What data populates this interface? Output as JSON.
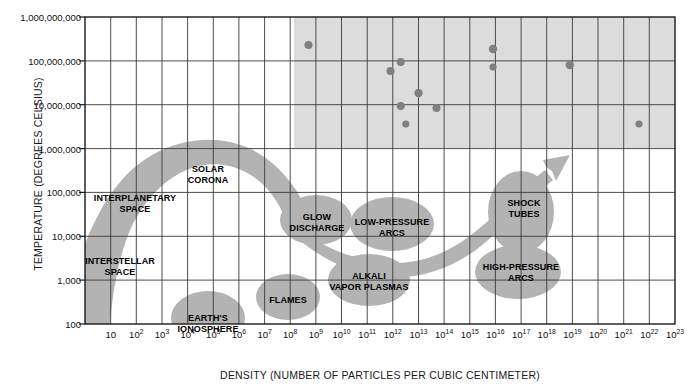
{
  "chart_data": {
    "type": "scatter",
    "title": "",
    "xlabel": "DENSITY (NUMBER OF PARTICLES PER CUBIC CENTIMETER)",
    "ylabel": "TEMPERATURE (DEGREES CELSIUS)",
    "xscale": "log",
    "yscale": "log",
    "xlim": [
      1,
      1e+23
    ],
    "ylim": [
      100,
      1000000000
    ],
    "grid": true,
    "legend": "none",
    "xticks": [
      {
        "label": "10",
        "exp": "",
        "value": 1
      },
      {
        "label": "10",
        "exp": "2",
        "value": 2
      },
      {
        "label": "10",
        "exp": "3",
        "value": 3
      },
      {
        "label": "10",
        "exp": "4",
        "value": 4
      },
      {
        "label": "10",
        "exp": "5",
        "value": 5
      },
      {
        "label": "10",
        "exp": "6",
        "value": 6
      },
      {
        "label": "10",
        "exp": "7",
        "value": 7
      },
      {
        "label": "10",
        "exp": "8",
        "value": 8
      },
      {
        "label": "10",
        "exp": "9",
        "value": 9
      },
      {
        "label": "10",
        "exp": "10",
        "value": 10
      },
      {
        "label": "10",
        "exp": "11",
        "value": 11
      },
      {
        "label": "10",
        "exp": "12",
        "value": 12
      },
      {
        "label": "10",
        "exp": "13",
        "value": 13
      },
      {
        "label": "10",
        "exp": "14",
        "value": 14
      },
      {
        "label": "10",
        "exp": "15",
        "value": 15
      },
      {
        "label": "10",
        "exp": "16",
        "value": 16
      },
      {
        "label": "10",
        "exp": "17",
        "value": 17
      },
      {
        "label": "10",
        "exp": "18",
        "value": 18
      },
      {
        "label": "10",
        "exp": "19",
        "value": 19
      },
      {
        "label": "10",
        "exp": "20",
        "value": 20
      },
      {
        "label": "10",
        "exp": "21",
        "value": 21
      },
      {
        "label": "10",
        "exp": "22",
        "value": 22
      },
      {
        "label": "10",
        "exp": "23",
        "value": 23
      }
    ],
    "yticks": [
      {
        "label": "1,000,000,000",
        "value": 9
      },
      {
        "label": "100,000,000",
        "value": 8
      },
      {
        "label": "10,000,000",
        "value": 7
      },
      {
        "label": "1,000,000",
        "value": 6
      },
      {
        "label": "100,000",
        "value": 5
      },
      {
        "label": "10,000",
        "value": 4
      },
      {
        "label": "1,000",
        "value": 3
      },
      {
        "label": "100",
        "value": 2
      }
    ],
    "points": [
      {
        "x": 9.7,
        "y": 8.35
      },
      {
        "x": 12.9,
        "y": 7.75
      },
      {
        "x": 13.3,
        "y": 7.95
      },
      {
        "x": 13.3,
        "y": 6.95
      },
      {
        "x": 13.5,
        "y": 6.55
      },
      {
        "x": 14.0,
        "y": 7.25
      },
      {
        "x": 14.7,
        "y": 6.9
      },
      {
        "x": 16.9,
        "y": 8.05
      },
      {
        "x": 16.9,
        "y": 7.65
      },
      {
        "x": 19.9,
        "y": 7.7
      },
      {
        "x": 22.6,
        "y": 6.55
      }
    ],
    "regions": [
      {
        "name": "solar-corona",
        "label": "SOLAR\nCORONA"
      },
      {
        "name": "interplanetary-space",
        "label": "INTERPLANETARY\nSPACE"
      },
      {
        "name": "interstellar-space",
        "label": "INTERSTELLAR\nSPACE"
      },
      {
        "name": "earths-ionosphere",
        "label": "EARTH'S\nIONOSPHERE"
      },
      {
        "name": "flames",
        "label": "FLAMES"
      },
      {
        "name": "glow-discharge",
        "label": "GLOW\nDISCHARGE"
      },
      {
        "name": "low-pressure-arcs",
        "label": "LOW-PRESSURE\nARCS"
      },
      {
        "name": "alkali-vapor-plasmas",
        "label": "ALKALI\nVAPOR PLASMAS"
      },
      {
        "name": "shock-tubes",
        "label": "SHOCK\nTUBES"
      },
      {
        "name": "high-pressure-arcs",
        "label": "HIGH-PRESSURE\nARCS"
      }
    ],
    "shaded_band": {
      "name": "fusion-region",
      "x_start": 8,
      "y_start": 6,
      "color": "#dcdcdc"
    },
    "colors": {
      "blob_fill": "#b3b3b3",
      "shaded_region": "#dcdcdc",
      "grid": "#3a3a3a",
      "point": "#808080",
      "text": "#000000"
    }
  },
  "region_labels": {
    "solar_corona_l1": "SOLAR",
    "solar_corona_l2": "CORONA",
    "interplanetary_l1": "INTERPLANETARY",
    "interplanetary_l2": "SPACE",
    "interstellar_l1": "INTERSTELLAR",
    "interstellar_l2": "SPACE",
    "ionosphere_l1": "EARTH'S",
    "ionosphere_l2": "IONOSPHERE",
    "flames_l1": "FLAMES",
    "glow_l1": "GLOW",
    "glow_l2": "DISCHARGE",
    "lowpress_l1": "LOW-PRESSURE",
    "lowpress_l2": "ARCS",
    "alkali_l1": "ALKALI",
    "alkali_l2": "VAPOR PLASMAS",
    "shock_l1": "SHOCK",
    "shock_l2": "TUBES",
    "highpress_l1": "HIGH-PRESSURE",
    "highpress_l2": "ARCS"
  }
}
